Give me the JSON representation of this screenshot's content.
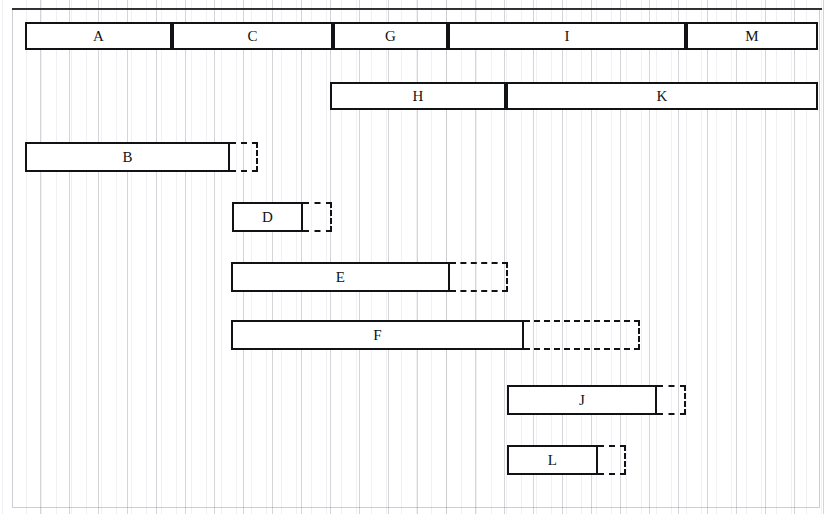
{
  "diagram": {
    "type": "gantt-bar-chart",
    "title": "",
    "canvas": {
      "width": 834,
      "height": 514
    },
    "grid": {
      "visible": true,
      "orientation": "vertical",
      "spacing_px": 29,
      "origin_x": 12
    },
    "frame": {
      "visible": true,
      "x": 12,
      "y": 8,
      "width": 808,
      "height": 500
    },
    "style": {
      "bar_stroke": "#111215",
      "bar_fill": "#ffffff",
      "slack_stroke": "#111215",
      "grid_color": "#787d87",
      "background": "#ffffff"
    }
  },
  "rows": [
    {
      "name": "row-1",
      "top": 22,
      "height": 28,
      "segments": [
        {
          "label": "A",
          "x": 25,
          "width": 147
        },
        {
          "label": "C",
          "x": 172,
          "width": 161
        },
        {
          "label": "G",
          "x": 333,
          "width": 115
        },
        {
          "label": "I",
          "x": 448,
          "width": 238
        },
        {
          "label": "M",
          "x": 686,
          "width": 132
        }
      ],
      "slack": null
    },
    {
      "name": "row-2",
      "top": 82,
      "height": 28,
      "segments": [
        {
          "label": "H",
          "x": 330,
          "width": 176
        },
        {
          "label": "K",
          "x": 506,
          "width": 312
        }
      ],
      "slack": null
    },
    {
      "name": "row-3",
      "top": 142,
      "height": 30,
      "segments": [
        {
          "label": "B",
          "x": 25,
          "width": 205
        }
      ],
      "slack": {
        "x": 230,
        "width": 28
      }
    },
    {
      "name": "row-4",
      "top": 202,
      "height": 30,
      "segments": [
        {
          "label": "D",
          "x": 232,
          "width": 71
        }
      ],
      "slack": {
        "x": 303,
        "width": 29
      }
    },
    {
      "name": "row-5",
      "top": 262,
      "height": 30,
      "segments": [
        {
          "label": "E",
          "x": 231,
          "width": 219
        }
      ],
      "slack": {
        "x": 450,
        "width": 58
      }
    },
    {
      "name": "row-6",
      "top": 320,
      "height": 30,
      "segments": [
        {
          "label": "F",
          "x": 231,
          "width": 293
        }
      ],
      "slack": {
        "x": 524,
        "width": 116
      }
    },
    {
      "name": "row-7",
      "top": 385,
      "height": 30,
      "segments": [
        {
          "label": "J",
          "x": 507,
          "width": 150
        }
      ],
      "slack": {
        "x": 657,
        "width": 29
      }
    },
    {
      "name": "row-8",
      "top": 445,
      "height": 30,
      "segments": [
        {
          "label": "L",
          "x": 507,
          "width": 91
        }
      ],
      "slack": {
        "x": 598,
        "width": 28
      }
    }
  ],
  "chart_data": {
    "type": "bar",
    "title": "",
    "xlabel": "",
    "ylabel": "",
    "orientation": "horizontal",
    "grid": true,
    "legend": null,
    "axis_units": "grid-columns (29 px each)",
    "xlim": [
      12,
      822
    ],
    "tasks": [
      {
        "label": "A",
        "row": 1,
        "start": 25,
        "end": 172,
        "duration": 147,
        "float": 0,
        "chained_with": [
          "C",
          "G",
          "I",
          "M"
        ]
      },
      {
        "label": "C",
        "row": 1,
        "start": 172,
        "end": 333,
        "duration": 161,
        "float": 0,
        "chained_with": [
          "A",
          "G",
          "I",
          "M"
        ]
      },
      {
        "label": "G",
        "row": 1,
        "start": 333,
        "end": 448,
        "duration": 115,
        "float": 0,
        "chained_with": [
          "A",
          "C",
          "I",
          "M"
        ]
      },
      {
        "label": "I",
        "row": 1,
        "start": 448,
        "end": 686,
        "duration": 238,
        "float": 0,
        "chained_with": [
          "A",
          "C",
          "G",
          "M"
        ]
      },
      {
        "label": "M",
        "row": 1,
        "start": 686,
        "end": 818,
        "duration": 132,
        "float": 0,
        "chained_with": [
          "A",
          "C",
          "G",
          "I"
        ]
      },
      {
        "label": "H",
        "row": 2,
        "start": 330,
        "end": 506,
        "duration": 176,
        "float": 0,
        "chained_with": [
          "K"
        ]
      },
      {
        "label": "K",
        "row": 2,
        "start": 506,
        "end": 818,
        "duration": 312,
        "float": 0,
        "chained_with": [
          "H"
        ]
      },
      {
        "label": "B",
        "row": 3,
        "start": 25,
        "end": 230,
        "duration": 205,
        "float": 28,
        "chained_with": []
      },
      {
        "label": "D",
        "row": 4,
        "start": 232,
        "end": 303,
        "duration": 71,
        "float": 29,
        "chained_with": []
      },
      {
        "label": "E",
        "row": 5,
        "start": 231,
        "end": 450,
        "duration": 219,
        "float": 58,
        "chained_with": []
      },
      {
        "label": "F",
        "row": 6,
        "start": 231,
        "end": 524,
        "duration": 293,
        "float": 116,
        "chained_with": []
      },
      {
        "label": "J",
        "row": 7,
        "start": 507,
        "end": 657,
        "duration": 150,
        "float": 29,
        "chained_with": []
      },
      {
        "label": "L",
        "row": 8,
        "start": 507,
        "end": 598,
        "duration": 91,
        "float": 28,
        "chained_with": []
      }
    ]
  }
}
